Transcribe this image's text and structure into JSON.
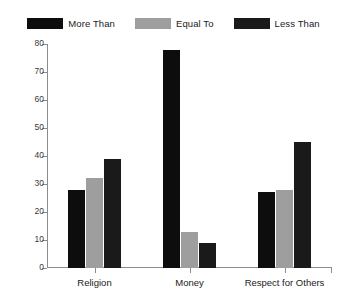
{
  "chart_data": {
    "type": "bar",
    "title": "",
    "subtitle": "",
    "xlabel": "",
    "ylabel": "",
    "categories": [
      "Religion",
      "Money",
      "Respect for Others"
    ],
    "series": [
      {
        "name": "More Than",
        "color": "#0d0d0d",
        "values": [
          28,
          78,
          27
        ]
      },
      {
        "name": "Equal To",
        "color": "#9e9e9e",
        "values": [
          32,
          13,
          28
        ]
      },
      {
        "name": "Less Than",
        "color": "#1a1a1a",
        "values": [
          39,
          9,
          45
        ]
      }
    ],
    "ylim": [
      0,
      80
    ],
    "yticks": [
      0,
      10,
      20,
      30,
      40,
      50,
      60,
      70,
      80
    ],
    "ytick_labels": [
      "0",
      "10",
      "20",
      "30",
      "40",
      "50",
      "60",
      "70",
      "80"
    ],
    "grid": false,
    "legend_position": "top",
    "axis_color": "#8c8c8c",
    "background": "#ffffff"
  }
}
